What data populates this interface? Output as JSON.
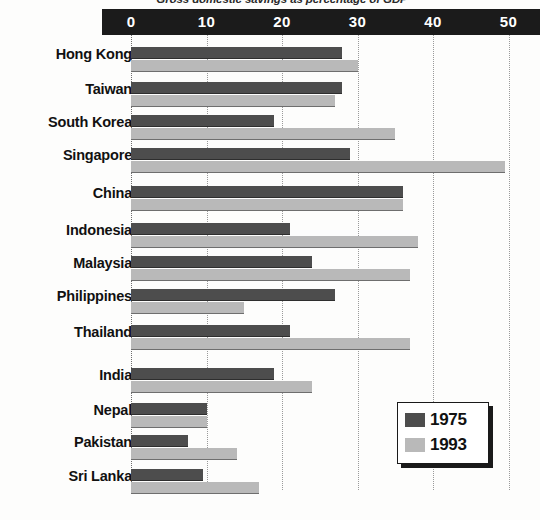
{
  "chart_data": {
    "type": "bar",
    "orientation": "horizontal",
    "title": "Gross domestic savings as percentage of GDP",
    "xlabel": "",
    "ylabel": "",
    "xlim": [
      0,
      53
    ],
    "xticks": [
      0,
      10,
      20,
      30,
      40,
      50
    ],
    "xtick_labels": [
      "0",
      "10",
      "20",
      "30",
      "40",
      "50"
    ],
    "grid": true,
    "legend_position": "bottom-right",
    "categories": [
      "Hong Kong",
      "Taiwan",
      "South Korea",
      "Singapore",
      "China",
      "Indonesia",
      "Malaysia",
      "Philippines",
      "Thailand",
      "India",
      "Nepal",
      "Pakistan",
      "Sri Lanka"
    ],
    "series": [
      {
        "name": "1975",
        "color": "#4d4d4d",
        "values": [
          28,
          28,
          19,
          29,
          36,
          21,
          24,
          27,
          21,
          19,
          10,
          7.5,
          9.5
        ]
      },
      {
        "name": "1993",
        "color": "#b9b9b9",
        "values": [
          30,
          27,
          35,
          49.5,
          36,
          38,
          37,
          15,
          37,
          24,
          10,
          14,
          17
        ]
      }
    ]
  },
  "legend": {
    "entries": [
      {
        "label": "1975",
        "swatch": "s1975"
      },
      {
        "label": "1993",
        "swatch": "s1993"
      }
    ]
  }
}
